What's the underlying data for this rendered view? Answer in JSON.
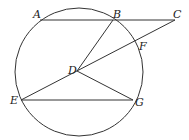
{
  "diagram": {
    "circle": {
      "cx": 79,
      "cy": 72,
      "r": 64,
      "center_label": "D"
    },
    "points": {
      "A": {
        "label": "A",
        "x": 40,
        "y": 20
      },
      "B": {
        "label": "B",
        "x": 113,
        "y": 20
      },
      "C": {
        "label": "C",
        "x": 175,
        "y": 20
      },
      "D": {
        "label": "D",
        "x": 77,
        "y": 71
      },
      "E": {
        "label": "E",
        "x": 21,
        "y": 100
      },
      "F": {
        "label": "F",
        "x": 136,
        "y": 43
      },
      "G": {
        "label": "G",
        "x": 133,
        "y": 100
      }
    },
    "segments": [
      [
        "A",
        "C"
      ],
      [
        "B",
        "D"
      ],
      [
        "C",
        "E"
      ],
      [
        "D",
        "G"
      ],
      [
        "E",
        "G"
      ]
    ]
  }
}
